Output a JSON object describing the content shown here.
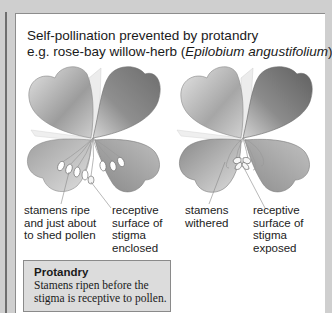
{
  "title": {
    "line1": "Self-pollination prevented by protandry",
    "line2_prefix": "e.g. rose-bay willow-herb (",
    "line2_italic": "Epilobium angustifolium",
    "line2_suffix": ")"
  },
  "diagrams": [
    {
      "stage": "early",
      "labels": {
        "stamens": [
          "stamens ripe",
          "and just about",
          "to shed pollen"
        ],
        "stigma": [
          "receptive",
          "surface of",
          "stigma",
          "enclosed"
        ]
      }
    },
    {
      "stage": "late",
      "labels": {
        "stamens": [
          "stamens",
          "withered"
        ],
        "stigma": [
          "receptive",
          "surface of",
          "stigma",
          "exposed"
        ]
      }
    }
  ],
  "note": {
    "title": "Protandry",
    "body_line1": "Stamens ripen before the",
    "body_line2": "stigma is receptive to pollen."
  },
  "colors": {
    "background": "#cfcfcf",
    "panel": "#ffffff",
    "note_box": "#dcdcdc",
    "petal_dark": "#6a6a6a",
    "petal_light": "#d8d8d8"
  }
}
